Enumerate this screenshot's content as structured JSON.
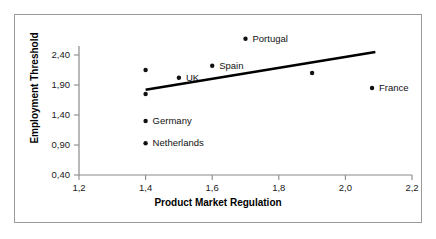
{
  "chart_data": {
    "type": "scatter",
    "title": "",
    "xlabel": "Product Market Regulation",
    "ylabel": "Employment Threshold",
    "xlim": [
      1.2,
      2.2
    ],
    "ylim": [
      0.4,
      2.9
    ],
    "xticks": [
      "1,2",
      "1,4",
      "1,6",
      "1,8",
      "2,0",
      "2,2"
    ],
    "xtick_values": [
      1.2,
      1.4,
      1.6,
      1.8,
      2.0,
      2.2
    ],
    "yticks": [
      "0,40",
      "0,90",
      "1,40",
      "1,90",
      "2,40"
    ],
    "ytick_values": [
      0.4,
      0.9,
      1.4,
      1.9,
      2.4
    ],
    "grid": false,
    "legend": "none",
    "decimal_separator": ",",
    "points": [
      {
        "label": "Portugal",
        "x": 1.7,
        "y": 2.67,
        "label_position": "right"
      },
      {
        "label": "Spain",
        "x": 1.6,
        "y": 2.22,
        "label_position": "right"
      },
      {
        "label": "UK",
        "x": 1.5,
        "y": 2.02,
        "label_position": "right"
      },
      {
        "label": "France",
        "x": 2.08,
        "y": 1.85,
        "label_position": "right"
      },
      {
        "label": "Germany",
        "x": 1.4,
        "y": 1.3,
        "label_position": "right"
      },
      {
        "label": "Netherlands",
        "x": 1.4,
        "y": 0.93,
        "label_position": "right"
      },
      {
        "label": "",
        "x": 1.4,
        "y": 2.15,
        "label_position": "none"
      },
      {
        "label": "",
        "x": 1.4,
        "y": 1.75,
        "label_position": "none"
      },
      {
        "label": "",
        "x": 1.9,
        "y": 2.1,
        "label_position": "none"
      }
    ],
    "trendline": {
      "type": "linear",
      "x_start": 1.4,
      "y_start": 1.82,
      "x_end": 2.09,
      "y_end": 2.45
    }
  }
}
